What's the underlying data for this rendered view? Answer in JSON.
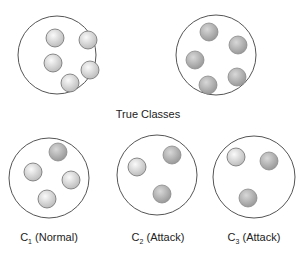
{
  "title": "True Classes",
  "colors": {
    "outline": "#555555",
    "normal_fill_light": "#f4f4f4",
    "normal_fill_dark": "#bdbdbd",
    "attack_fill_light": "#d4d4d4",
    "attack_fill_dark": "#9a9a9a",
    "ball_stroke": "#7a7a7a"
  },
  "true_classes": [
    {
      "name": "true-class-normal",
      "circle": {
        "cx": 57,
        "cy": 55,
        "r": 39
      },
      "balls": [
        {
          "cx": 55,
          "cy": 38,
          "type": "normal"
        },
        {
          "cx": 88,
          "cy": 40,
          "type": "normal"
        },
        {
          "cx": 53,
          "cy": 63,
          "type": "normal"
        },
        {
          "cx": 90,
          "cy": 70,
          "type": "normal"
        },
        {
          "cx": 70,
          "cy": 83,
          "type": "normal"
        }
      ]
    },
    {
      "name": "true-class-attack",
      "circle": {
        "cx": 216,
        "cy": 55,
        "r": 40
      },
      "balls": [
        {
          "cx": 209,
          "cy": 32,
          "type": "attack"
        },
        {
          "cx": 238,
          "cy": 45,
          "type": "attack"
        },
        {
          "cx": 195,
          "cy": 60,
          "type": "attack"
        },
        {
          "cx": 237,
          "cy": 77,
          "type": "attack"
        },
        {
          "cx": 208,
          "cy": 85,
          "type": "attack"
        }
      ]
    }
  ],
  "clusters": [
    {
      "name": "cluster-c1",
      "label_main": "C",
      "label_sub": "1",
      "label_rest": " (Normal)",
      "label_x": 49,
      "circle": {
        "cx": 49,
        "cy": 178,
        "r": 40
      },
      "balls": [
        {
          "cx": 58,
          "cy": 152,
          "type": "attack"
        },
        {
          "cx": 33,
          "cy": 172,
          "type": "normal"
        },
        {
          "cx": 71,
          "cy": 180,
          "type": "normal"
        },
        {
          "cx": 47,
          "cy": 199,
          "type": "normal"
        }
      ]
    },
    {
      "name": "cluster-c2",
      "label_main": "C",
      "label_sub": "2",
      "label_rest": " (Attack)",
      "label_x": 158,
      "circle": {
        "cx": 157,
        "cy": 175,
        "r": 40
      },
      "balls": [
        {
          "cx": 137,
          "cy": 167,
          "type": "normal"
        },
        {
          "cx": 172,
          "cy": 155,
          "type": "attack"
        },
        {
          "cx": 162,
          "cy": 194,
          "type": "attack"
        }
      ]
    },
    {
      "name": "cluster-c3",
      "label_main": "C",
      "label_sub": "3",
      "label_rest": " (Attack)",
      "label_x": 254,
      "circle": {
        "cx": 254,
        "cy": 177,
        "r": 41
      },
      "balls": [
        {
          "cx": 236,
          "cy": 157,
          "type": "normal"
        },
        {
          "cx": 269,
          "cy": 161,
          "type": "attack"
        },
        {
          "cx": 248,
          "cy": 198,
          "type": "attack"
        }
      ]
    }
  ],
  "ball_radius": 9,
  "title_pos": {
    "x": 148,
    "y": 118
  },
  "label_y": 241
}
